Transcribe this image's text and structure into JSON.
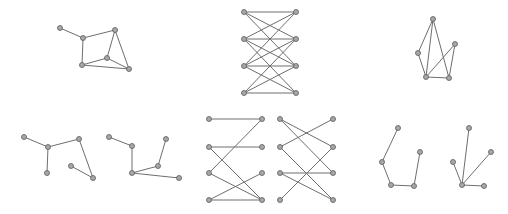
{
  "style": {
    "edge_color": "#6e6e6e",
    "node_fill": "#a8a8a8",
    "node_stroke": "#5a5a5a",
    "node_radius": 2.5
  },
  "graphs": [
    {
      "id": "graph-top-left",
      "nodes": [
        [
          60,
          28
        ],
        [
          83,
          38
        ],
        [
          115,
          30
        ],
        [
          82,
          65
        ],
        [
          107,
          58
        ],
        [
          129,
          69
        ]
      ],
      "edges": [
        [
          0,
          1
        ],
        [
          1,
          2
        ],
        [
          1,
          3
        ],
        [
          2,
          4
        ],
        [
          2,
          5
        ],
        [
          3,
          4
        ],
        [
          3,
          5
        ],
        [
          4,
          5
        ]
      ]
    },
    {
      "id": "graph-top-middle-bipartite",
      "nodes": [
        [
          244,
          12
        ],
        [
          244,
          39
        ],
        [
          244,
          66
        ],
        [
          244,
          93
        ],
        [
          296,
          12
        ],
        [
          296,
          39
        ],
        [
          296,
          66
        ],
        [
          296,
          93
        ]
      ],
      "edges": [
        [
          0,
          4
        ],
        [
          0,
          5
        ],
        [
          0,
          6
        ],
        [
          1,
          4
        ],
        [
          1,
          5
        ],
        [
          1,
          6
        ],
        [
          1,
          7
        ],
        [
          2,
          4
        ],
        [
          2,
          5
        ],
        [
          2,
          6
        ],
        [
          2,
          7
        ],
        [
          3,
          5
        ],
        [
          3,
          6
        ],
        [
          3,
          7
        ]
      ]
    },
    {
      "id": "graph-top-right",
      "nodes": [
        [
          433,
          19
        ],
        [
          418,
          53
        ],
        [
          455,
          44
        ],
        [
          426,
          77
        ],
        [
          449,
          78
        ]
      ],
      "edges": [
        [
          0,
          1
        ],
        [
          0,
          3
        ],
        [
          0,
          4
        ],
        [
          1,
          3
        ],
        [
          3,
          4
        ],
        [
          3,
          2
        ],
        [
          2,
          4
        ]
      ]
    },
    {
      "id": "graph-bottom-left-a",
      "nodes": [
        [
          24,
          137
        ],
        [
          48,
          147
        ],
        [
          79,
          139
        ],
        [
          47,
          173
        ],
        [
          71,
          166
        ],
        [
          93,
          178
        ]
      ],
      "edges": [
        [
          0,
          1
        ],
        [
          1,
          2
        ],
        [
          1,
          3
        ],
        [
          2,
          5
        ],
        [
          4,
          5
        ]
      ]
    },
    {
      "id": "graph-bottom-left-b",
      "nodes": [
        [
          109,
          137
        ],
        [
          132,
          146
        ],
        [
          166,
          139
        ],
        [
          158,
          166
        ],
        [
          132,
          173
        ],
        [
          179,
          178
        ]
      ],
      "edges": [
        [
          0,
          1
        ],
        [
          1,
          4
        ],
        [
          4,
          3
        ],
        [
          3,
          2
        ],
        [
          4,
          5
        ]
      ]
    },
    {
      "id": "graph-bottom-middle-a",
      "nodes": [
        [
          209,
          119
        ],
        [
          209,
          147
        ],
        [
          209,
          173
        ],
        [
          209,
          200
        ],
        [
          262,
          119
        ],
        [
          262,
          147
        ],
        [
          262,
          173
        ],
        [
          262,
          200
        ]
      ],
      "edges": [
        [
          0,
          4
        ],
        [
          4,
          2
        ],
        [
          1,
          5
        ],
        [
          1,
          7
        ],
        [
          2,
          7
        ],
        [
          3,
          6
        ],
        [
          3,
          7
        ]
      ]
    },
    {
      "id": "graph-bottom-middle-b",
      "nodes": [
        [
          280,
          119
        ],
        [
          280,
          147
        ],
        [
          280,
          173
        ],
        [
          280,
          200
        ],
        [
          333,
          119
        ],
        [
          333,
          147
        ],
        [
          333,
          173
        ],
        [
          333,
          200
        ]
      ],
      "edges": [
        [
          0,
          5
        ],
        [
          0,
          6
        ],
        [
          1,
          4
        ],
        [
          1,
          7
        ],
        [
          2,
          6
        ],
        [
          2,
          7
        ],
        [
          3,
          5
        ]
      ]
    },
    {
      "id": "graph-bottom-right-a",
      "nodes": [
        [
          398,
          128
        ],
        [
          382,
          162
        ],
        [
          391,
          185
        ],
        [
          414,
          186
        ],
        [
          420,
          152
        ]
      ],
      "edges": [
        [
          0,
          1
        ],
        [
          1,
          2
        ],
        [
          2,
          3
        ],
        [
          3,
          4
        ]
      ]
    },
    {
      "id": "graph-bottom-right-b",
      "nodes": [
        [
          469,
          128
        ],
        [
          453,
          162
        ],
        [
          462,
          185
        ],
        [
          491,
          152
        ],
        [
          484,
          186
        ]
      ],
      "edges": [
        [
          2,
          0
        ],
        [
          2,
          1
        ],
        [
          2,
          3
        ],
        [
          2,
          4
        ]
      ]
    }
  ]
}
